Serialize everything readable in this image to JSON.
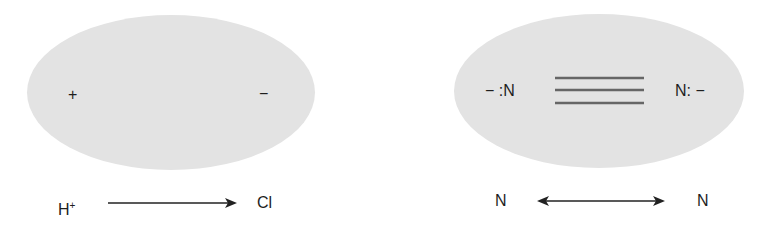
{
  "panels": [
    {
      "name": "polar-molecule",
      "cloud_color": "#e3e3e3",
      "charges": {
        "left": "+",
        "right": "−"
      },
      "bottom": {
        "left_atom": "H",
        "left_superscript": "+",
        "right_atom": "Cl",
        "arrow": "single-right"
      }
    },
    {
      "name": "nonpolar-molecule",
      "cloud_color": "#e3e3e3",
      "left_label": "− :N",
      "right_label": "N: −",
      "bond": "triple",
      "bottom": {
        "left_atom": "N",
        "right_atom": "N",
        "arrow": "double-headed"
      }
    }
  ]
}
